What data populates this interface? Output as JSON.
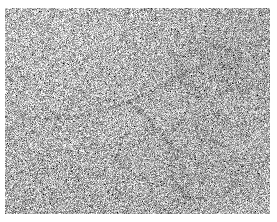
{
  "figure": {
    "kind": "electron-micrograph",
    "modality": "transmission electron microscopy",
    "specimen": "nucleic acid filament with loops",
    "color_mode": "grayscale",
    "background_color": "#ffffff",
    "plate_mean_color": "#b4b4b4",
    "grain_dark_color": "#1a1a1a",
    "grain_light_color": "#f2f2f2",
    "feature_color": "#3a3a3a",
    "overlay_text": "",
    "scale_bar_label": "",
    "axis_labels": [],
    "legend": []
  },
  "plate": {
    "x": 5,
    "y": 8,
    "width": 265,
    "height": 206
  },
  "noise": {
    "grain_px": 1,
    "mean_level": 178,
    "contrast_spread": 95,
    "seed": 20240517
  },
  "features": [
    {
      "id": "filament-main",
      "name": "diagonal-filament",
      "type": "polyline",
      "points": "18,108 42,112 68,110 92,104 118,96 142,86 164,74 186,62 202,54",
      "stroke_width": 1.6,
      "opacity": 0.85
    },
    {
      "id": "filament-branch",
      "name": "lower-filament-branch",
      "type": "polyline",
      "points": "126,96 140,106 152,120 162,134 172,144 186,150 200,152",
      "stroke_width": 1.4,
      "opacity": 0.7
    },
    {
      "id": "loop-upper-right",
      "name": "upper-right-loop",
      "type": "ellipse",
      "cx": 203,
      "cy": 64,
      "rx": 30,
      "ry": 26,
      "rotation": -14,
      "stroke_width": 1.7,
      "opacity": 0.8
    },
    {
      "id": "loop-lower-right",
      "name": "lower-right-loop",
      "type": "ellipse",
      "cx": 200,
      "cy": 162,
      "rx": 34,
      "ry": 30,
      "rotation": 12,
      "stroke_width": 1.7,
      "opacity": 0.75
    },
    {
      "id": "arc-lower-tail",
      "name": "lower-tail-arc",
      "type": "polyline",
      "points": "176,188 190,192 206,190 220,182",
      "stroke_width": 1.5,
      "opacity": 0.7
    },
    {
      "id": "arc-left-wisp",
      "name": "left-wisp-arc",
      "type": "polyline",
      "points": "10,96 26,102 46,104",
      "stroke_width": 1.2,
      "opacity": 0.5
    }
  ]
}
